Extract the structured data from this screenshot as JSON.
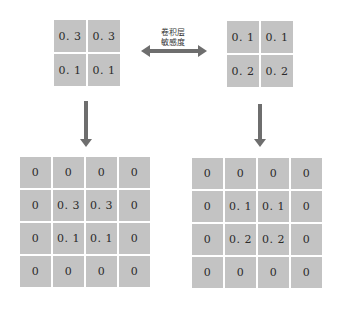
{
  "top_left_grid": {
    "values": [
      [
        "0. 3",
        "0. 3"
      ],
      [
        "0. 1",
        "0. 1"
      ]
    ]
  },
  "top_right_grid": {
    "values": [
      [
        "0. 1",
        "0. 1"
      ],
      [
        "0. 2",
        "0. 2"
      ]
    ]
  },
  "bottom_left_grid": {
    "values": [
      [
        "0",
        "0",
        "0",
        "0"
      ],
      [
        "0",
        "0. 3",
        "0. 3",
        "0"
      ],
      [
        "0",
        "0. 1",
        "0. 1",
        "0"
      ],
      [
        "0",
        "0",
        "0",
        "0"
      ]
    ]
  },
  "bottom_right_grid": {
    "values": [
      [
        "0",
        "0",
        "0",
        "0"
      ],
      [
        "0",
        "0. 1",
        "0. 1",
        "0"
      ],
      [
        "0",
        "0. 2",
        "0. 2",
        "0"
      ],
      [
        "0",
        "0",
        "0",
        "0"
      ]
    ]
  },
  "center_label": {
    "line1": "卷积层",
    "line2": "敏感度"
  },
  "colors": {
    "cell": "#c3c3c3",
    "arrow": "#6e6e6e",
    "text": "#2b2b2b"
  }
}
